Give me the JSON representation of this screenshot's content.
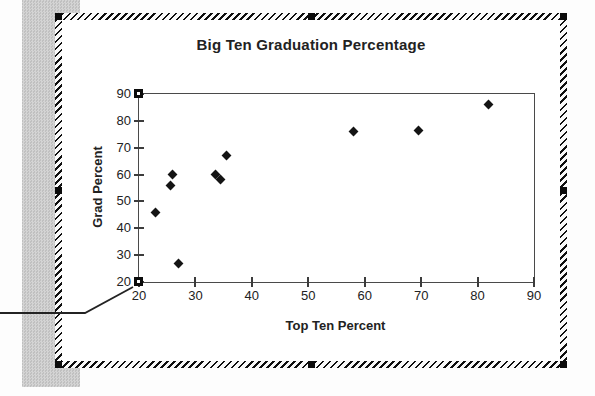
{
  "chart_data": {
    "type": "scatter",
    "title": "Big Ten Graduation Percentage",
    "xlabel": "Top Ten Percent",
    "ylabel": "Grad Percent",
    "xlim": [
      20,
      90
    ],
    "ylim": [
      20,
      90
    ],
    "xticks": [
      20,
      30,
      40,
      50,
      60,
      70,
      80,
      90
    ],
    "yticks": [
      20,
      30,
      40,
      50,
      60,
      70,
      80,
      90
    ],
    "grid": false,
    "legend": false,
    "marker": "diamond",
    "points": [
      [
        23,
        46
      ],
      [
        25.5,
        56
      ],
      [
        26,
        60
      ],
      [
        27,
        27
      ],
      [
        33.5,
        60
      ],
      [
        34.5,
        58
      ],
      [
        35.5,
        67
      ],
      [
        58,
        76
      ],
      [
        69.5,
        76.5
      ],
      [
        82,
        86
      ]
    ]
  },
  "colors": {
    "marker": "#141414",
    "axis": "#3c3c3c",
    "marquee": "#101010",
    "gray_bar": "#c9c9c9",
    "chart_bg": "#ffffff"
  }
}
